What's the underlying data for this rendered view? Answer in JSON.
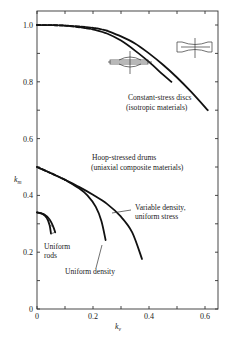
{
  "chart_data": {
    "type": "line",
    "title": "",
    "xlabel": "k_v",
    "ylabel": "k_m",
    "xlim": [
      0,
      0.65
    ],
    "ylim": [
      0,
      1.05
    ],
    "grid": false,
    "x_ticks": [
      0,
      0.1,
      0.2,
      0.3,
      0.4,
      0.5,
      0.6
    ],
    "x_tick_labels": [
      "0",
      "",
      "0.2",
      "",
      "0.4",
      "",
      "0.6"
    ],
    "y_ticks": [
      0,
      0.1,
      0.2,
      0.3,
      0.4,
      0.5,
      0.6,
      0.7,
      0.8,
      0.9,
      1.0
    ],
    "y_tick_labels": [
      "0",
      "",
      "0.2",
      "",
      "0.4",
      "",
      "0.6",
      "",
      "0.8",
      "",
      "1.0"
    ],
    "series": [
      {
        "name": "Constant-stress disc (inner)",
        "group": "Constant-stress discs (isotropic materials)",
        "dashed_until_x": 0.2,
        "points": [
          [
            0,
            1.0
          ],
          [
            0.1,
            0.998
          ],
          [
            0.2,
            0.985
          ],
          [
            0.25,
            0.97
          ],
          [
            0.3,
            0.945
          ],
          [
            0.35,
            0.91
          ],
          [
            0.4,
            0.87
          ],
          [
            0.45,
            0.825
          ],
          [
            0.48,
            0.8
          ]
        ]
      },
      {
        "name": "Constant-stress disc (outer)",
        "group": "Constant-stress discs (isotropic materials)",
        "dashed_until_x": 0.25,
        "points": [
          [
            0,
            1.0
          ],
          [
            0.1,
            0.998
          ],
          [
            0.2,
            0.99
          ],
          [
            0.25,
            0.98
          ],
          [
            0.3,
            0.96
          ],
          [
            0.35,
            0.935
          ],
          [
            0.4,
            0.9
          ],
          [
            0.45,
            0.86
          ],
          [
            0.5,
            0.815
          ],
          [
            0.55,
            0.765
          ],
          [
            0.61,
            0.7
          ]
        ]
      },
      {
        "name": "Uniform density",
        "group": "Hoop-stressed drums (uniaxial composite materials)",
        "dashed_until_x": 0.1,
        "points": [
          [
            0,
            0.5
          ],
          [
            0.05,
            0.478
          ],
          [
            0.1,
            0.455
          ],
          [
            0.15,
            0.425
          ],
          [
            0.18,
            0.4
          ],
          [
            0.21,
            0.36
          ],
          [
            0.23,
            0.31
          ],
          [
            0.245,
            0.243
          ]
        ]
      },
      {
        "name": "Variable density, uniform stress",
        "group": "Hoop-stressed drums (uniaxial composite materials)",
        "dashed_until_x": 0.1,
        "points": [
          [
            0,
            0.5
          ],
          [
            0.05,
            0.478
          ],
          [
            0.1,
            0.455
          ],
          [
            0.15,
            0.43
          ],
          [
            0.2,
            0.402
          ],
          [
            0.25,
            0.37
          ],
          [
            0.3,
            0.325
          ],
          [
            0.34,
            0.27
          ],
          [
            0.375,
            0.176
          ]
        ]
      },
      {
        "name": "Uniform rods (a)",
        "group": "Uniform rods",
        "points": [
          [
            0,
            0.34
          ],
          [
            0.02,
            0.335
          ],
          [
            0.035,
            0.32
          ],
          [
            0.045,
            0.295
          ],
          [
            0.05,
            0.265
          ]
        ]
      },
      {
        "name": "Uniform rods (b)",
        "group": "Uniform rods",
        "points": [
          [
            0,
            0.34
          ],
          [
            0.025,
            0.333
          ],
          [
            0.045,
            0.315
          ],
          [
            0.058,
            0.29
          ],
          [
            0.065,
            0.27
          ]
        ]
      }
    ],
    "annotations": [
      {
        "text": "Constant-stress discs",
        "line2": "(isotropic materials)"
      },
      {
        "text": "Hoop-stressed drums",
        "line2": "(uniaxial composite materials)"
      },
      {
        "text": "Variable density,",
        "line2": "uniform stress"
      },
      {
        "text": "Uniform density",
        "line2": ""
      },
      {
        "text": "Uniform",
        "line2": "rods"
      }
    ],
    "icons": [
      "disc-profile-icon",
      "drum-profile-icon"
    ]
  }
}
